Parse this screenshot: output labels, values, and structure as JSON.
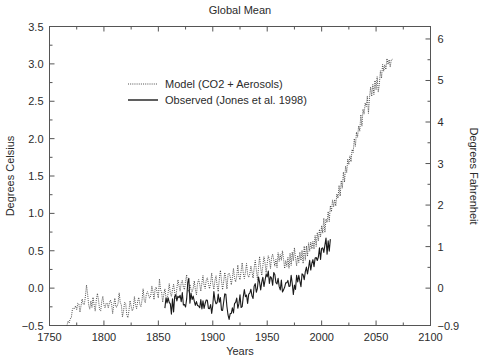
{
  "chart_data": {
    "type": "line",
    "title": "Global Mean",
    "xlabel": "Years",
    "ylabel": "Degrees Celsius",
    "y2label": "Degrees Fahrenheit",
    "xlim": [
      1750,
      2100
    ],
    "ylim": [
      -0.5,
      3.5
    ],
    "y2lim": [
      -0.9,
      6.3
    ],
    "grid": false,
    "legend_position": "upper-left-inside",
    "xticks": [
      "1750",
      "1800",
      "1850",
      "1900",
      "1950",
      "2000",
      "2050",
      "2100"
    ],
    "xtick_values": [
      1750,
      1800,
      1850,
      1900,
      1950,
      2000,
      2050,
      2100
    ],
    "xminor_step": 25,
    "yticks": [
      "-0.5",
      "0.0",
      "0.5",
      "1.0",
      "1.5",
      "2.0",
      "2.5",
      "3.0",
      "3.5"
    ],
    "ytick_values": [
      -0.5,
      0.0,
      0.5,
      1.0,
      1.5,
      2.0,
      2.5,
      3.0,
      3.5
    ],
    "yminor_step": 0.25,
    "y2ticks": [
      "-0.9",
      "0",
      "1",
      "2",
      "3",
      "4",
      "5",
      "6"
    ],
    "y2tick_values": [
      -0.9,
      0,
      1,
      2,
      3,
      4,
      5,
      6
    ],
    "series": [
      {
        "name": "Model (CO2 + Aerosols)",
        "style": "dotted",
        "color": "#3a3a3a",
        "x_start": 1766,
        "x_end": 2065,
        "x_step": 1,
        "values": [
          -0.47,
          -0.45,
          -0.46,
          -0.44,
          -0.42,
          -0.3,
          -0.22,
          -0.25,
          -0.2,
          -0.26,
          -0.18,
          -0.24,
          -0.3,
          -0.21,
          -0.13,
          -0.22,
          -0.26,
          -0.15,
          0.03,
          -0.08,
          -0.2,
          -0.28,
          -0.19,
          -0.24,
          -0.13,
          -0.21,
          -0.27,
          -0.17,
          -0.1,
          -0.19,
          -0.24,
          -0.3,
          -0.21,
          -0.12,
          -0.2,
          -0.27,
          -0.16,
          -0.23,
          -0.31,
          -0.22,
          -0.14,
          -0.24,
          -0.3,
          -0.2,
          -0.12,
          -0.21,
          -0.28,
          -0.17,
          -0.09,
          -0.19,
          -0.26,
          -0.34,
          -0.27,
          -0.18,
          -0.24,
          -0.32,
          -0.38,
          -0.3,
          -0.21,
          -0.28,
          -0.33,
          -0.24,
          -0.15,
          -0.22,
          -0.3,
          -0.2,
          -0.12,
          -0.19,
          -0.26,
          -0.14,
          -0.05,
          -0.13,
          -0.2,
          -0.1,
          -0.02,
          -0.09,
          -0.17,
          -0.06,
          0.02,
          -0.06,
          -0.14,
          -0.04,
          0.05,
          -0.03,
          -0.11,
          0.12,
          0.02,
          -0.06,
          -0.16,
          -0.07,
          0.01,
          -0.1,
          -0.18,
          -0.06,
          0.03,
          -0.05,
          -0.13,
          0.0,
          0.09,
          -0.02,
          -0.1,
          0.02,
          0.11,
          0.0,
          -0.08,
          0.04,
          0.13,
          0.02,
          -0.06,
          0.06,
          0.15,
          0.03,
          -0.05,
          0.08,
          0.0,
          -0.09,
          0.02,
          0.12,
          0.01,
          -0.07,
          0.05,
          0.14,
          0.02,
          -0.06,
          0.07,
          0.16,
          0.04,
          -0.04,
          0.08,
          0.17,
          0.05,
          -0.03,
          0.09,
          0.18,
          0.06,
          -0.02,
          0.1,
          0.19,
          0.07,
          -0.01,
          0.11,
          0.2,
          0.08,
          0.0,
          0.12,
          0.22,
          0.1,
          0.02,
          0.14,
          0.24,
          0.12,
          0.03,
          0.15,
          0.26,
          0.13,
          0.05,
          0.17,
          0.28,
          0.16,
          0.07,
          0.19,
          0.3,
          0.18,
          0.09,
          0.21,
          0.32,
          0.2,
          0.11,
          0.23,
          0.34,
          0.22,
          0.13,
          0.26,
          0.37,
          0.25,
          0.15,
          0.28,
          0.4,
          0.28,
          0.18,
          0.31,
          0.43,
          0.31,
          0.21,
          0.34,
          0.46,
          0.34,
          0.24,
          0.37,
          0.5,
          0.38,
          0.27,
          0.41,
          0.3,
          0.43,
          0.33,
          0.45,
          0.35,
          0.48,
          0.37,
          0.26,
          0.39,
          0.28,
          0.42,
          0.31,
          0.45,
          0.34,
          0.47,
          0.36,
          0.5,
          0.39,
          0.28,
          0.41,
          0.31,
          0.45,
          0.34,
          0.48,
          0.37,
          0.52,
          0.41,
          0.55,
          0.44,
          0.58,
          0.47,
          0.62,
          0.5,
          0.66,
          0.54,
          0.7,
          0.58,
          0.74,
          0.62,
          0.79,
          0.67,
          0.84,
          0.72,
          0.9,
          0.78,
          0.96,
          0.84,
          1.02,
          0.91,
          1.09,
          0.98,
          1.16,
          1.05,
          1.23,
          1.12,
          1.3,
          1.2,
          1.38,
          1.27,
          1.45,
          1.35,
          1.53,
          1.43,
          1.62,
          1.52,
          1.71,
          1.61,
          1.8,
          1.7,
          1.89,
          1.79,
          1.98,
          1.88,
          2.08,
          1.98,
          2.18,
          2.08,
          2.28,
          2.18,
          2.38,
          2.29,
          2.48,
          2.39,
          2.58,
          2.37,
          2.55,
          2.68,
          2.58,
          2.72,
          2.63,
          2.78,
          2.68,
          2.84,
          2.62,
          2.74,
          2.9,
          2.8,
          2.95,
          2.86,
          3.0,
          2.91,
          3.05,
          2.95,
          3.02,
          2.98,
          3.05,
          3.06
        ]
      },
      {
        "name": "Observed (Jones et al. 1998)",
        "style": "solid",
        "color": "#1a1a1a",
        "x_start": 1856,
        "x_end": 1998,
        "x_step": 1,
        "values": [
          -0.22,
          -0.12,
          -0.2,
          -0.1,
          -0.16,
          -0.26,
          -0.35,
          -0.18,
          -0.3,
          -0.12,
          -0.14,
          -0.18,
          -0.08,
          -0.12,
          -0.14,
          -0.2,
          -0.08,
          -0.18,
          -0.24,
          -0.28,
          -0.14,
          0.06,
          0.1,
          -0.18,
          -0.1,
          -0.12,
          -0.14,
          -0.2,
          -0.25,
          -0.18,
          -0.22,
          -0.28,
          -0.22,
          -0.14,
          -0.26,
          -0.2,
          -0.3,
          -0.22,
          -0.18,
          -0.12,
          -0.24,
          -0.28,
          -0.22,
          -0.3,
          -0.26,
          -0.08,
          -0.12,
          -0.24,
          -0.18,
          -0.1,
          -0.22,
          -0.16,
          -0.26,
          -0.3,
          -0.24,
          -0.12,
          -0.1,
          -0.2,
          -0.34,
          -0.38,
          -0.3,
          -0.36,
          -0.26,
          -0.28,
          -0.18,
          -0.22,
          -0.14,
          -0.26,
          -0.18,
          -0.12,
          -0.24,
          -0.2,
          -0.12,
          -0.06,
          -0.14,
          -0.08,
          -0.18,
          -0.1,
          -0.04,
          0.0,
          -0.06,
          -0.1,
          -0.02,
          0.04,
          -0.04,
          0.02,
          0.1,
          0.04,
          0.0,
          0.08,
          0.14,
          0.06,
          0.12,
          0.2,
          0.1,
          0.18,
          0.06,
          0.14,
          0.08,
          0.02,
          0.16,
          0.22,
          0.12,
          0.04,
          0.14,
          0.06,
          -0.02,
          0.08,
          0.0,
          -0.06,
          0.04,
          0.1,
          0.02,
          0.06,
          -0.02,
          0.08,
          0.14,
          0.04,
          -0.04,
          0.06,
          0.0,
          0.12,
          0.04,
          0.16,
          0.08,
          0.02,
          0.14,
          0.22,
          0.12,
          0.18,
          0.26,
          0.16,
          0.24,
          0.32,
          0.22,
          0.3,
          0.38,
          0.28,
          0.36,
          0.45,
          0.34,
          0.42,
          0.52,
          0.4,
          0.48,
          0.58,
          0.46,
          0.55,
          0.62,
          0.5,
          0.6,
          0.52,
          0.65
        ]
      }
    ]
  },
  "legend": {
    "items": [
      {
        "label": "Model (CO2 + Aerosols)",
        "style": "dotted"
      },
      {
        "label": "Observed (Jones et al. 1998)",
        "style": "solid"
      }
    ]
  }
}
